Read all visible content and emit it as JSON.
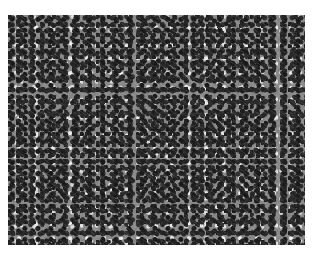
{
  "image": {
    "description": "Grayscale histology micrograph showing densely packed cells with dark nuclei and lighter cytoplasm",
    "colors": {
      "background": "#ffffff",
      "tissue_mid": "#8a8a8a",
      "nuclei": "#1a1a1a",
      "highlights": "#eeeeee"
    }
  }
}
